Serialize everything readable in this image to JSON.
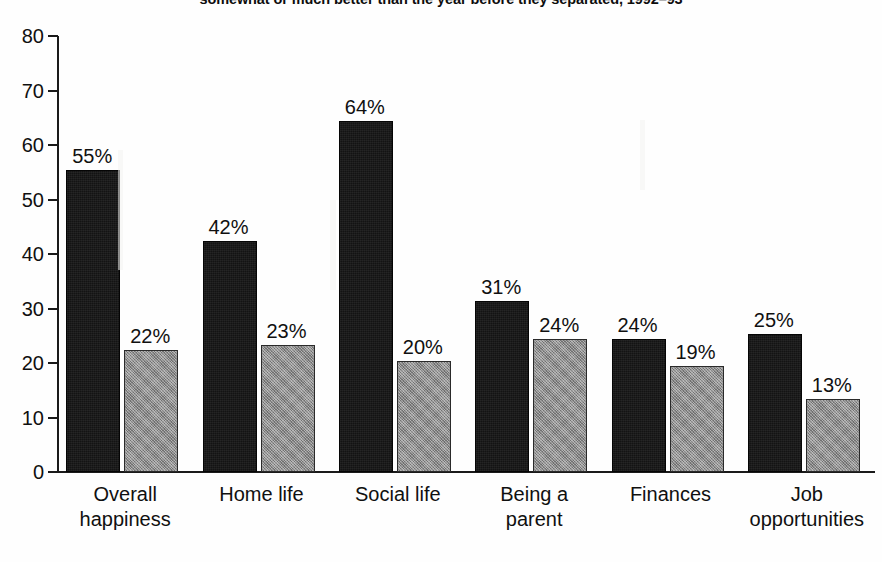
{
  "chart_data": {
    "type": "bar",
    "title": "somewhat or much better than the year before they separated, 1992–93",
    "xlabel": "",
    "ylabel": "",
    "ylim": [
      0,
      80
    ],
    "ytick_values": [
      80,
      70,
      60,
      50,
      40,
      30,
      20,
      10,
      0
    ],
    "ytick_labels": [
      "80",
      "70",
      "60",
      "50",
      "40",
      "30",
      "20",
      "10",
      "0"
    ],
    "grid": false,
    "legend": "none",
    "value_label_suffix": "%",
    "categories": [
      "Overall\nhappiness",
      "Home life",
      "Social life",
      "Being a\nparent",
      "Finances",
      "Job\nopportunities"
    ],
    "series": [
      {
        "name": "series-1",
        "color": "#131313",
        "values": [
          55,
          42,
          64,
          31,
          24,
          25
        ],
        "labels": [
          "55%",
          "42%",
          "64%",
          "31%",
          "24%",
          "25%"
        ]
      },
      {
        "name": "series-2",
        "color": "#8e8e8e",
        "values": [
          22,
          23,
          20,
          24,
          19,
          13
        ],
        "labels": [
          "22%",
          "23%",
          "20%",
          "24%",
          "19%",
          "13%"
        ]
      }
    ]
  },
  "colors": {
    "background": "#fefefe",
    "axis": "#1a1a1a",
    "text": "#101010",
    "series_dark": "#131313",
    "series_gray": "#8e8e8e"
  }
}
